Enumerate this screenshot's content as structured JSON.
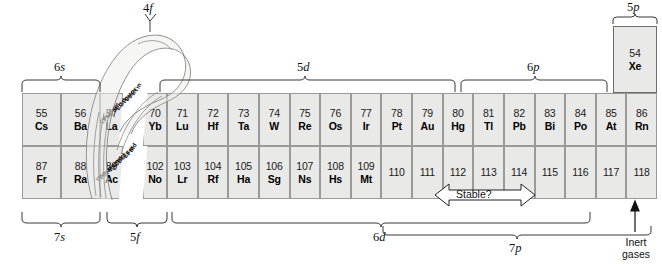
{
  "diagram": {
    "colors": {
      "cell_fill": "#e9e9e7",
      "cell_border": "#9a9a97",
      "highlight_border": "#6d6d6b",
      "text": "#111111",
      "page_background": "#ffffff"
    }
  },
  "orbital_labels": {
    "top_left": "6s",
    "top_f": "4f",
    "top_d": "5d",
    "top_p": "6p",
    "top_right_p": "5p",
    "bottom_left": "7s",
    "bottom_f": "5f",
    "bottom_d": "6d",
    "bottom_p": "7p"
  },
  "annotations": {
    "stable": "Stable?",
    "inert_gases_line1": "Inert",
    "inert_gases_line2": "gases"
  },
  "period6": [
    {
      "number": "55",
      "symbol": "Cs"
    },
    {
      "number": "56",
      "symbol": "Ba"
    },
    {
      "number": "57",
      "symbol": "La"
    },
    {
      "number": "70",
      "symbol": "Yb"
    },
    {
      "number": "71",
      "symbol": "Lu"
    },
    {
      "number": "72",
      "symbol": "Hf"
    },
    {
      "number": "73",
      "symbol": "Ta"
    },
    {
      "number": "74",
      "symbol": "W"
    },
    {
      "number": "75",
      "symbol": "Re"
    },
    {
      "number": "76",
      "symbol": "Os"
    },
    {
      "number": "77",
      "symbol": "Ir"
    },
    {
      "number": "78",
      "symbol": "Pt"
    },
    {
      "number": "79",
      "symbol": "Au"
    },
    {
      "number": "80",
      "symbol": "Hg"
    },
    {
      "number": "81",
      "symbol": "Tl"
    },
    {
      "number": "82",
      "symbol": "Pb"
    },
    {
      "number": "83",
      "symbol": "Bi"
    },
    {
      "number": "84",
      "symbol": "Po"
    },
    {
      "number": "85",
      "symbol": "At"
    },
    {
      "number": "86",
      "symbol": "Rn"
    }
  ],
  "period7": [
    {
      "number": "87",
      "symbol": "Fr"
    },
    {
      "number": "88",
      "symbol": "Ra"
    },
    {
      "number": "89",
      "symbol": "Ac"
    },
    {
      "number": "102",
      "symbol": "No"
    },
    {
      "number": "103",
      "symbol": "Lr"
    },
    {
      "number": "104",
      "symbol": "Rf"
    },
    {
      "number": "105",
      "symbol": "Ha"
    },
    {
      "number": "106",
      "symbol": "Sg"
    },
    {
      "number": "107",
      "symbol": "Ns"
    },
    {
      "number": "108",
      "symbol": "Hs"
    },
    {
      "number": "109",
      "symbol": "Mt"
    },
    {
      "number": "110",
      "symbol": ""
    },
    {
      "number": "111",
      "symbol": ""
    },
    {
      "number": "112",
      "symbol": ""
    },
    {
      "number": "113",
      "symbol": ""
    },
    {
      "number": "114",
      "symbol": ""
    },
    {
      "number": "115",
      "symbol": ""
    },
    {
      "number": "116",
      "symbol": ""
    },
    {
      "number": "117",
      "symbol": ""
    },
    {
      "number": "118",
      "symbol": ""
    }
  ],
  "noble_column": {
    "number": "54",
    "symbol": "Xe"
  },
  "loop_lanthanides": [
    {
      "number": "58",
      "symbol": "Ce"
    },
    {
      "number": "59",
      "symbol": "Pr"
    },
    {
      "number": "60",
      "symbol": "Nd"
    },
    {
      "number": "61",
      "symbol": "Pm"
    },
    {
      "number": "62",
      "symbol": "Sm"
    },
    {
      "number": "63",
      "symbol": "Eu"
    },
    {
      "number": "64",
      "symbol": "Gd"
    },
    {
      "number": "65",
      "symbol": "Tb"
    },
    {
      "number": "66",
      "symbol": "Dy"
    },
    {
      "number": "67",
      "symbol": "Ho"
    },
    {
      "number": "68",
      "symbol": "Er"
    },
    {
      "number": "69",
      "symbol": "Tm"
    }
  ],
  "loop_actinides": [
    {
      "number": "90",
      "symbol": "Th"
    },
    {
      "number": "91",
      "symbol": "Pa"
    },
    {
      "number": "92",
      "symbol": "U"
    },
    {
      "number": "93",
      "symbol": "Np"
    },
    {
      "number": "94",
      "symbol": "Pu"
    },
    {
      "number": "95",
      "symbol": "Am"
    },
    {
      "number": "96",
      "symbol": "Cm"
    },
    {
      "number": "97",
      "symbol": "Bk"
    },
    {
      "number": "98",
      "symbol": "Cf"
    },
    {
      "number": "99",
      "symbol": "Es"
    },
    {
      "number": "100",
      "symbol": "Fm"
    },
    {
      "number": "101",
      "symbol": "Md"
    }
  ]
}
